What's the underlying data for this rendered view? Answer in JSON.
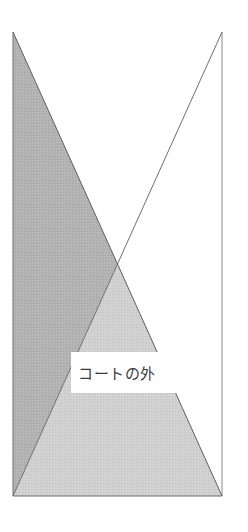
{
  "diagram": {
    "type": "court-diagram",
    "frame": {
      "left": 13,
      "top": 32,
      "right": 222,
      "bottom": 496
    },
    "regions": [
      {
        "name": "left-triangle",
        "fill": "#b3b3b3"
      },
      {
        "name": "bottom-triangle",
        "fill": "#d0d0d0"
      },
      {
        "name": "top-triangle",
        "fill": "#ffffff"
      },
      {
        "name": "right-triangle",
        "fill": "#ffffff"
      }
    ],
    "line_color": "#6e6e6e",
    "label": {
      "text": "コートの外"
    }
  }
}
